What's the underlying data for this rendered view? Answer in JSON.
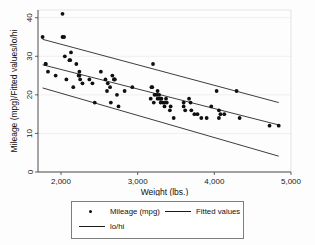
{
  "chart_data": {
    "type": "scatter",
    "title": "",
    "xlabel": "Weight (lbs.)",
    "ylabel": "Mileage (mpg)/Fitted values/lo/hi",
    "xlim": [
      1700,
      5000
    ],
    "ylim": [
      0,
      42
    ],
    "xticks": [
      2000,
      3000,
      4000,
      5000
    ],
    "xticklabels": [
      "2,000",
      "3,000",
      "4,000",
      "5,000"
    ],
    "yticks": [
      0,
      10,
      20,
      30,
      40
    ],
    "yticklabels": [
      "0",
      "10",
      "20",
      "30",
      "40"
    ],
    "grid": "horizontal-light",
    "legend_position": "below-plot",
    "marker_color": "#101010",
    "line_color": "#1a1a1a",
    "series": [
      {
        "name": "Mileage (mpg)",
        "type": "scatter",
        "points": [
          [
            1760,
            35
          ],
          [
            1800,
            28
          ],
          [
            1800,
            28
          ],
          [
            1830,
            26
          ],
          [
            1930,
            25
          ],
          [
            2020,
            41
          ],
          [
            2020,
            35
          ],
          [
            2040,
            35
          ],
          [
            2050,
            30
          ],
          [
            2070,
            24
          ],
          [
            2110,
            29
          ],
          [
            2120,
            29
          ],
          [
            2130,
            31
          ],
          [
            2160,
            22
          ],
          [
            2200,
            28
          ],
          [
            2230,
            25
          ],
          [
            2240,
            26
          ],
          [
            2240,
            25
          ],
          [
            2250,
            24
          ],
          [
            2280,
            23
          ],
          [
            2370,
            24
          ],
          [
            2410,
            23
          ],
          [
            2440,
            18
          ],
          [
            2520,
            26
          ],
          [
            2580,
            24
          ],
          [
            2600,
            21
          ],
          [
            2610,
            23
          ],
          [
            2640,
            22
          ],
          [
            2650,
            18
          ],
          [
            2670,
            25
          ],
          [
            2690,
            24
          ],
          [
            2700,
            24
          ],
          [
            2700,
            24
          ],
          [
            2730,
            20
          ],
          [
            2750,
            17
          ],
          [
            2830,
            21
          ],
          [
            2930,
            22
          ],
          [
            3170,
            19
          ],
          [
            3180,
            22
          ],
          [
            3190,
            22
          ],
          [
            3200,
            28
          ],
          [
            3210,
            18
          ],
          [
            3220,
            20
          ],
          [
            3250,
            20
          ],
          [
            3260,
            21
          ],
          [
            3260,
            19
          ],
          [
            3280,
            20
          ],
          [
            3290,
            19
          ],
          [
            3300,
            19
          ],
          [
            3300,
            18
          ],
          [
            3310,
            19
          ],
          [
            3330,
            18
          ],
          [
            3350,
            18
          ],
          [
            3350,
            17
          ],
          [
            3370,
            19
          ],
          [
            3380,
            18
          ],
          [
            3420,
            16
          ],
          [
            3430,
            17
          ],
          [
            3470,
            14
          ],
          [
            3600,
            18
          ],
          [
            3600,
            17
          ],
          [
            3620,
            16
          ],
          [
            3670,
            19
          ],
          [
            3690,
            18
          ],
          [
            3700,
            16
          ],
          [
            3740,
            15
          ],
          [
            3780,
            15
          ],
          [
            3830,
            14
          ],
          [
            3900,
            14
          ],
          [
            3960,
            17
          ],
          [
            4030,
            21
          ],
          [
            4060,
            16
          ],
          [
            4060,
            14
          ],
          [
            4080,
            15
          ],
          [
            4130,
            15
          ],
          [
            4290,
            21
          ],
          [
            4330,
            14
          ],
          [
            4720,
            12
          ],
          [
            4840,
            12
          ]
        ]
      },
      {
        "name": "Fitted values",
        "type": "line",
        "points": [
          [
            1760,
            27.8
          ],
          [
            4840,
            12.2
          ]
        ]
      },
      {
        "name": "lo/hi",
        "type": "line-band",
        "upper": [
          [
            1760,
            34.4
          ],
          [
            4840,
            18.0
          ]
        ],
        "lower": [
          [
            1760,
            21.8
          ],
          [
            4840,
            4.1
          ]
        ]
      }
    ],
    "legend_entries": [
      {
        "label": "Mileage (mpg)",
        "key": "dot"
      },
      {
        "label": "Fitted values",
        "key": "line"
      },
      {
        "label": "lo/hi",
        "key": "line"
      }
    ]
  },
  "axes": {
    "x_title": "Weight (lbs.)",
    "y_title": "Mileage (mpg)/Fitted values/lo/hi",
    "x_labels": [
      "2,000",
      "3,000",
      "4,000",
      "5,000"
    ],
    "y_labels": [
      "0",
      "10",
      "20",
      "30",
      "40"
    ]
  },
  "legend": {
    "items": [
      {
        "label": "Mileage (mpg)"
      },
      {
        "label": "Fitted values"
      },
      {
        "label": "lo/hi"
      }
    ]
  }
}
